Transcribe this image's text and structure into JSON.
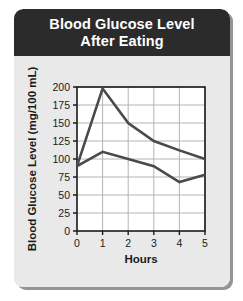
{
  "card": {
    "title_line1": "Blood Glucose Level",
    "title_line2": "After Eating",
    "header_color": "#2b2b2b",
    "background_color": "#e9e9e9",
    "plot_background_color": "#ffffff",
    "grid_color": "#b4b4b4",
    "axis_color": "#1a1a1a",
    "line_color": "#4a4a4a"
  },
  "chart_data": {
    "type": "line",
    "title": "Blood Glucose Level After Eating",
    "xlabel": "Hours",
    "ylabel": "Blood Glucose Level (mg/100 mL)",
    "x": [
      0,
      1,
      2,
      3,
      4,
      5
    ],
    "xlim": [
      0,
      5
    ],
    "ylim": [
      0,
      200
    ],
    "xticks": [
      "0",
      "1",
      "2",
      "3",
      "4",
      "5"
    ],
    "yticks": [
      "0",
      "25",
      "50",
      "75",
      "100",
      "125",
      "150",
      "175",
      "200"
    ],
    "grid": true,
    "legend": "none",
    "series": [
      {
        "name": "upper-curve",
        "values": [
          90,
          198,
          150,
          125,
          112,
          100
        ]
      },
      {
        "name": "lower-curve",
        "values": [
          90,
          110,
          100,
          90,
          68,
          78
        ]
      }
    ]
  }
}
